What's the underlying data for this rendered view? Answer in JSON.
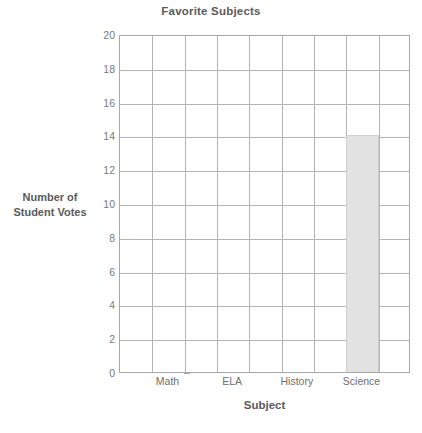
{
  "chart_data": {
    "type": "bar",
    "title": "Favorite Subjects",
    "xlabel": "Subject",
    "ylabel": "Number of Student Votes",
    "categories": [
      "Math",
      "ELA",
      "History",
      "Science"
    ],
    "values": [
      0,
      0,
      0,
      14
    ],
    "ylim": [
      0,
      20
    ],
    "ytick_step": 2,
    "ytick_labels": [
      "0",
      "2",
      "4",
      "6",
      "8",
      "10",
      "12",
      "14",
      "16",
      "18",
      "20"
    ],
    "grid": true,
    "grid_columns": 9,
    "legend": "none",
    "bar_color": "#e2e2e2",
    "grid_color": "#b4b4b4",
    "axis_color": "#a8a8a8",
    "text_color": "#5a5a5a",
    "category_columns": [
      1,
      3,
      5,
      7
    ]
  }
}
